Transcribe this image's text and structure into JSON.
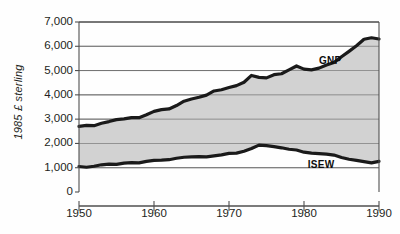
{
  "chart_data": {
    "type": "area",
    "title": "",
    "xlabel": "",
    "ylabel": "1985 £ sterling",
    "xlim": [
      1950,
      1990
    ],
    "ylim": [
      0,
      7000
    ],
    "grid": true,
    "legend_position": "inline-annotations",
    "xticks": [
      "1950",
      "1960",
      "1970",
      "1980",
      "1990"
    ],
    "xtick_values": [
      1950,
      1960,
      1970,
      1980,
      1990
    ],
    "yticks": [
      "0",
      "1,000",
      "2,000",
      "3,000",
      "4,000",
      "5,000",
      "6,000",
      "7,000"
    ],
    "ytick_values": [
      0,
      1000,
      2000,
      3000,
      4000,
      5000,
      6000,
      7000
    ],
    "colors": {
      "line": "#1a1a1a",
      "band_fill": "#d2d2d2",
      "grid": "#6f6f6f",
      "axis": "#4f4f4f",
      "background": "#fefefe"
    },
    "annotations": [
      {
        "text": "GNP",
        "x": 1982.0,
        "y": 5450
      },
      {
        "text": "ISEW",
        "x": 1980.5,
        "y": 1150
      }
    ],
    "x": [
      1950,
      1951,
      1952,
      1953,
      1954,
      1955,
      1956,
      1957,
      1958,
      1959,
      1960,
      1961,
      1962,
      1963,
      1964,
      1965,
      1966,
      1967,
      1968,
      1969,
      1970,
      1971,
      1972,
      1973,
      1974,
      1975,
      1976,
      1977,
      1978,
      1979,
      1980,
      1981,
      1982,
      1983,
      1984,
      1985,
      1986,
      1987,
      1988,
      1989,
      1990
    ],
    "series": [
      {
        "name": "GNP",
        "values": [
          2700,
          2740,
          2730,
          2830,
          2900,
          2980,
          3010,
          3060,
          3060,
          3180,
          3320,
          3390,
          3420,
          3560,
          3740,
          3830,
          3900,
          3990,
          4160,
          4210,
          4300,
          4380,
          4520,
          4800,
          4720,
          4700,
          4830,
          4870,
          5030,
          5190,
          5060,
          5030,
          5100,
          5230,
          5330,
          5570,
          5790,
          6020,
          6290,
          6350,
          6300
        ]
      },
      {
        "name": "ISEW",
        "values": [
          1050,
          1020,
          1060,
          1120,
          1150,
          1140,
          1190,
          1210,
          1200,
          1260,
          1300,
          1310,
          1330,
          1390,
          1430,
          1450,
          1460,
          1450,
          1490,
          1530,
          1590,
          1600,
          1680,
          1790,
          1930,
          1910,
          1870,
          1820,
          1760,
          1730,
          1640,
          1600,
          1580,
          1560,
          1520,
          1420,
          1350,
          1300,
          1250,
          1200,
          1260
        ]
      }
    ]
  }
}
